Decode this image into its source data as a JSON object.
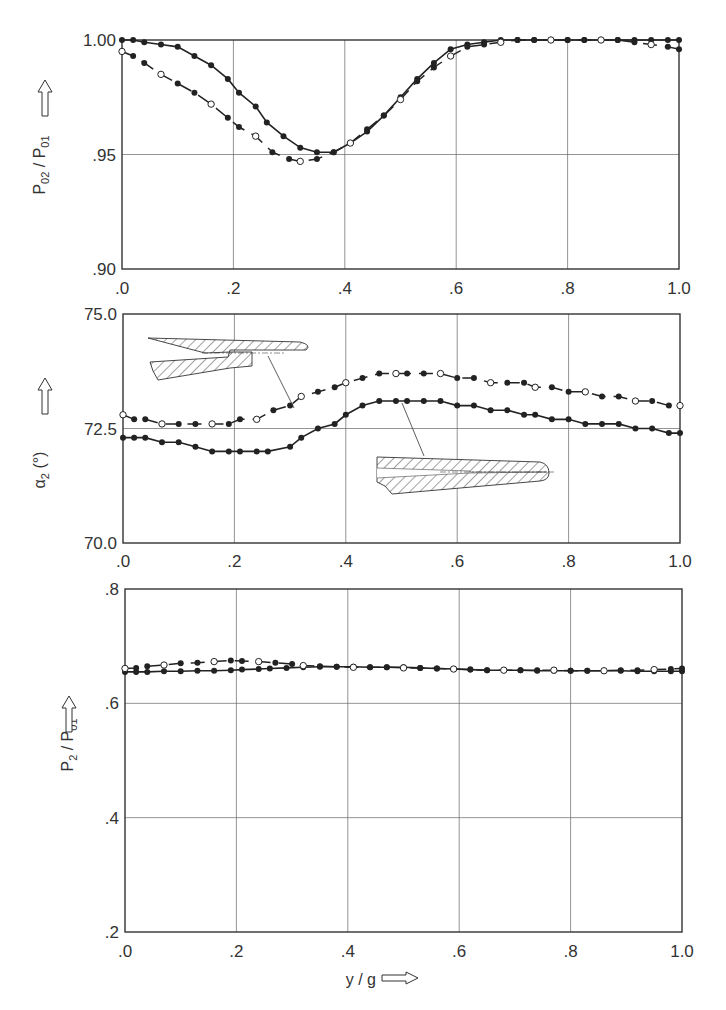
{
  "chart_data": [
    {
      "type": "line",
      "title": "",
      "xlabel": "y / g",
      "ylabel": "P02 / P01",
      "xlim": [
        0.0,
        1.0
      ],
      "ylim": [
        0.9,
        1.0
      ],
      "xticks": [
        ".0",
        ".2",
        ".4",
        ".6",
        ".8",
        "1.0"
      ],
      "yticks": [
        ".90",
        ".95",
        "1.00"
      ],
      "grid": true,
      "series": [
        {
          "name": "solid (plain trailing edge)",
          "style": "solid",
          "x": [
            0.0,
            0.02,
            0.04,
            0.07,
            0.1,
            0.13,
            0.16,
            0.19,
            0.21,
            0.24,
            0.26,
            0.29,
            0.32,
            0.35,
            0.38,
            0.41,
            0.44,
            0.47,
            0.5,
            0.53,
            0.56,
            0.59,
            0.62,
            0.65,
            0.68,
            0.71,
            0.74,
            0.77,
            0.8,
            0.83,
            0.86,
            0.89,
            0.92,
            0.95,
            0.98,
            1.0
          ],
          "y": [
            1.0,
            1.0,
            0.999,
            0.998,
            0.997,
            0.993,
            0.989,
            0.983,
            0.977,
            0.971,
            0.964,
            0.958,
            0.953,
            0.951,
            0.951,
            0.955,
            0.96,
            0.967,
            0.975,
            0.983,
            0.99,
            0.996,
            0.998,
            0.999,
            1.0,
            1.0,
            1.0,
            1.0,
            1.0,
            1.0,
            1.0,
            1.0,
            1.0,
            1.0,
            1.0,
            1.0
          ],
          "markers": "filled"
        },
        {
          "name": "dashed (trailing edge with ejection)",
          "style": "dashed",
          "x": [
            0.0,
            0.02,
            0.04,
            0.07,
            0.1,
            0.13,
            0.16,
            0.19,
            0.21,
            0.24,
            0.27,
            0.3,
            0.32,
            0.35,
            0.38,
            0.41,
            0.44,
            0.47,
            0.5,
            0.53,
            0.56,
            0.59,
            0.62,
            0.65,
            0.68,
            0.71,
            0.74,
            0.77,
            0.8,
            0.83,
            0.86,
            0.89,
            0.92,
            0.95,
            0.98,
            1.0
          ],
          "y": [
            0.995,
            0.993,
            0.99,
            0.985,
            0.981,
            0.977,
            0.972,
            0.966,
            0.962,
            0.958,
            0.951,
            0.948,
            0.947,
            0.948,
            0.951,
            0.955,
            0.961,
            0.967,
            0.974,
            0.982,
            0.988,
            0.993,
            0.997,
            0.998,
            0.999,
            1.0,
            1.0,
            1.0,
            1.0,
            1.0,
            1.0,
            1.0,
            0.999,
            0.998,
            0.997,
            0.996
          ],
          "markers": "alternating open/filled"
        }
      ]
    },
    {
      "type": "line",
      "title": "",
      "xlabel": "y / g",
      "ylabel": "α2 (°)",
      "xlim": [
        0.0,
        1.0
      ],
      "ylim": [
        70.0,
        75.0
      ],
      "xticks": [
        ".0",
        ".2",
        ".4",
        ".6",
        ".8",
        "1.0"
      ],
      "yticks": [
        "70.0",
        "72.5",
        "75.0"
      ],
      "grid": true,
      "annotations": [
        "blade trailing-edge section with slot (dashed curve)",
        "blade trailing-edge section plain (solid curve)"
      ],
      "series": [
        {
          "name": "solid (plain trailing edge)",
          "style": "solid",
          "x": [
            0.0,
            0.02,
            0.04,
            0.07,
            0.1,
            0.13,
            0.16,
            0.19,
            0.21,
            0.24,
            0.26,
            0.3,
            0.32,
            0.35,
            0.38,
            0.4,
            0.43,
            0.46,
            0.49,
            0.51,
            0.54,
            0.57,
            0.6,
            0.63,
            0.66,
            0.69,
            0.72,
            0.74,
            0.77,
            0.8,
            0.83,
            0.86,
            0.89,
            0.92,
            0.95,
            0.98,
            1.0
          ],
          "y": [
            72.3,
            72.3,
            72.3,
            72.2,
            72.2,
            72.1,
            72.0,
            72.0,
            72.0,
            72.0,
            72.0,
            72.1,
            72.3,
            72.5,
            72.6,
            72.8,
            73.0,
            73.1,
            73.1,
            73.1,
            73.1,
            73.1,
            73.0,
            73.0,
            72.9,
            72.9,
            72.8,
            72.8,
            72.7,
            72.7,
            72.6,
            72.6,
            72.6,
            72.5,
            72.5,
            72.4,
            72.4
          ],
          "markers": "filled"
        },
        {
          "name": "dashed (trailing edge with slot)",
          "style": "dashed",
          "x": [
            0.0,
            0.02,
            0.04,
            0.07,
            0.1,
            0.13,
            0.16,
            0.19,
            0.21,
            0.24,
            0.27,
            0.3,
            0.32,
            0.35,
            0.38,
            0.4,
            0.43,
            0.46,
            0.49,
            0.51,
            0.54,
            0.57,
            0.6,
            0.63,
            0.66,
            0.69,
            0.72,
            0.74,
            0.77,
            0.8,
            0.83,
            0.86,
            0.89,
            0.92,
            0.95,
            0.98,
            1.0
          ],
          "y": [
            72.8,
            72.7,
            72.7,
            72.6,
            72.6,
            72.6,
            72.6,
            72.6,
            72.7,
            72.7,
            72.9,
            73.0,
            73.2,
            73.3,
            73.4,
            73.5,
            73.6,
            73.7,
            73.7,
            73.7,
            73.7,
            73.7,
            73.6,
            73.6,
            73.5,
            73.5,
            73.5,
            73.4,
            73.4,
            73.3,
            73.3,
            73.2,
            73.2,
            73.1,
            73.1,
            73.0,
            73.0
          ],
          "markers": "alternating open/filled"
        }
      ]
    },
    {
      "type": "line",
      "title": "",
      "xlabel": "y / g",
      "ylabel": "P2 / P01",
      "xlim": [
        0.0,
        1.0
      ],
      "ylim": [
        0.2,
        0.8
      ],
      "xticks": [
        ".0",
        ".2",
        ".4",
        ".6",
        ".8",
        "1.0"
      ],
      "yticks": [
        ".2",
        ".4",
        ".6",
        ".8"
      ],
      "grid": true,
      "series": [
        {
          "name": "solid (plain trailing edge)",
          "style": "solid",
          "x": [
            0.0,
            0.02,
            0.04,
            0.07,
            0.1,
            0.13,
            0.16,
            0.19,
            0.21,
            0.24,
            0.26,
            0.29,
            0.32,
            0.35,
            0.38,
            0.41,
            0.44,
            0.47,
            0.5,
            0.53,
            0.56,
            0.59,
            0.62,
            0.65,
            0.68,
            0.71,
            0.74,
            0.77,
            0.8,
            0.83,
            0.86,
            0.89,
            0.92,
            0.95,
            0.98,
            1.0
          ],
          "y": [
            0.655,
            0.655,
            0.655,
            0.656,
            0.656,
            0.657,
            0.657,
            0.658,
            0.659,
            0.66,
            0.661,
            0.662,
            0.663,
            0.664,
            0.664,
            0.664,
            0.663,
            0.663,
            0.663,
            0.662,
            0.661,
            0.66,
            0.659,
            0.658,
            0.658,
            0.658,
            0.657,
            0.657,
            0.657,
            0.657,
            0.657,
            0.657,
            0.656,
            0.656,
            0.656,
            0.656
          ],
          "markers": "filled"
        },
        {
          "name": "dashed (trailing edge with slot)",
          "style": "dashed",
          "x": [
            0.0,
            0.02,
            0.04,
            0.07,
            0.1,
            0.13,
            0.16,
            0.19,
            0.21,
            0.24,
            0.27,
            0.3,
            0.32,
            0.35,
            0.38,
            0.41,
            0.44,
            0.47,
            0.5,
            0.53,
            0.56,
            0.59,
            0.62,
            0.65,
            0.68,
            0.71,
            0.74,
            0.77,
            0.8,
            0.83,
            0.86,
            0.89,
            0.92,
            0.95,
            0.98,
            1.0
          ],
          "y": [
            0.661,
            0.662,
            0.665,
            0.667,
            0.67,
            0.671,
            0.673,
            0.675,
            0.674,
            0.673,
            0.671,
            0.669,
            0.666,
            0.665,
            0.664,
            0.663,
            0.663,
            0.663,
            0.662,
            0.662,
            0.661,
            0.66,
            0.659,
            0.658,
            0.658,
            0.658,
            0.658,
            0.658,
            0.657,
            0.657,
            0.657,
            0.658,
            0.658,
            0.659,
            0.66,
            0.661
          ],
          "markers": "alternating open/filled"
        }
      ]
    }
  ],
  "labels": {
    "plot1_ylabel_main": "P",
    "plot1_ylabel_sub1": "02",
    "plot1_ylabel_sep": " / ",
    "plot1_ylabel_main2": "P",
    "plot1_ylabel_sub2": "01",
    "plot2_ylabel_main": "α",
    "plot2_ylabel_sub": "2",
    "plot2_ylabel_unit": " (°)",
    "plot3_ylabel_main": "P",
    "plot3_ylabel_sub1": "2",
    "plot3_ylabel_sep": " / ",
    "plot3_ylabel_main2": "P",
    "plot3_ylabel_sub2": "01",
    "xlabel": "y / g",
    "arrow_icon": "hollow-arrow"
  }
}
